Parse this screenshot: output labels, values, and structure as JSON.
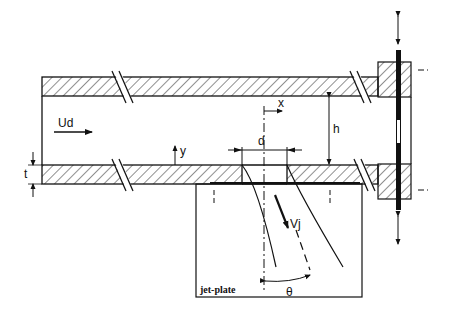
{
  "diagram": {
    "labels": {
      "crossflow_velocity": "Ud",
      "jet_velocity": "Vj",
      "hole_diameter": "d",
      "channel_height": "h",
      "wall_thickness": "t",
      "x_axis": "x",
      "y_axis": "y",
      "jet_angle": "θ",
      "plate": "jet-plate"
    },
    "colors": {
      "line": "#111111",
      "background": "#ffffff"
    }
  }
}
